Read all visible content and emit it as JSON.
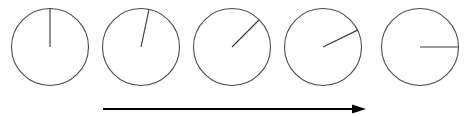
{
  "figure": {
    "name": "clock-rotation-sequence",
    "background_color": "#ffffff",
    "width": 474,
    "height": 116
  },
  "dials": {
    "count": 5,
    "radius": 38.5,
    "center_y": 47,
    "hand_length": 38.5,
    "circle_color": "#4a4a4a",
    "hand_color": "#3a3a3a",
    "items": [
      {
        "label": "dial-1",
        "center_x": 50,
        "angle_deg": 0,
        "clock_position": "12:00"
      },
      {
        "label": "dial-2",
        "center_x": 141,
        "angle_deg": 12,
        "clock_position": "12:02"
      },
      {
        "label": "dial-3",
        "center_x": 232,
        "angle_deg": 45,
        "clock_position": "1:30"
      },
      {
        "label": "dial-4",
        "center_x": 323,
        "angle_deg": 64,
        "clock_position": "2:08"
      },
      {
        "label": "dial-5",
        "center_x": 420,
        "angle_deg": 90,
        "clock_position": "3:00"
      }
    ]
  },
  "arrow": {
    "label": "time-progression-arrow",
    "color": "#000000",
    "x_start": 103,
    "x_end": 366,
    "y": 109,
    "head_width": 14,
    "head_height": 9
  }
}
